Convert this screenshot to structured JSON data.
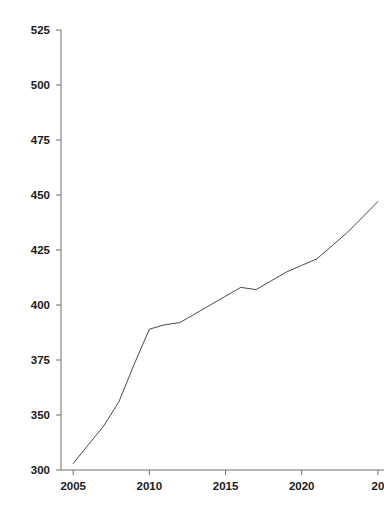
{
  "chart_data": {
    "type": "line",
    "title": "",
    "subtitle": "",
    "xlabel": "",
    "ylabel": "",
    "xlim": [
      2004.2,
      2025.4
    ],
    "ylim": [
      300,
      525
    ],
    "grid": false,
    "legend": null,
    "x_ticks": [
      {
        "value": 2005,
        "label": "2005"
      },
      {
        "value": 2010,
        "label": "2010"
      },
      {
        "value": 2015,
        "label": "2015"
      },
      {
        "value": 2020,
        "label": "2020"
      },
      {
        "value": 2025,
        "label": "20"
      }
    ],
    "y_ticks": [
      {
        "value": 300,
        "label": "300"
      },
      {
        "value": 350,
        "label": "350"
      },
      {
        "value": 375,
        "label": "375"
      },
      {
        "value": 400,
        "label": "400"
      },
      {
        "value": 425,
        "label": "425"
      },
      {
        "value": 450,
        "label": "450"
      },
      {
        "value": 475,
        "label": "475"
      },
      {
        "value": 500,
        "label": "500"
      },
      {
        "value": 525,
        "label": "525"
      }
    ],
    "series": [
      {
        "name": "series-1",
        "color": "#4a4a4a",
        "x": [
          2005,
          2006,
          2007,
          2008,
          2009,
          2010,
          2011,
          2012,
          2013,
          2014,
          2015,
          2016,
          2017,
          2018,
          2019,
          2020,
          2021,
          2022,
          2023,
          2024,
          2025
        ],
        "values": [
          306,
          323,
          340,
          356,
          373,
          389,
          391,
          392,
          396,
          400,
          404,
          408,
          407,
          411,
          415,
          418,
          421,
          427,
          433,
          440,
          447
        ]
      }
    ],
    "annotations": []
  },
  "axes": {
    "y_axis_name": "y-axis",
    "x_axis_name": "x-axis"
  }
}
